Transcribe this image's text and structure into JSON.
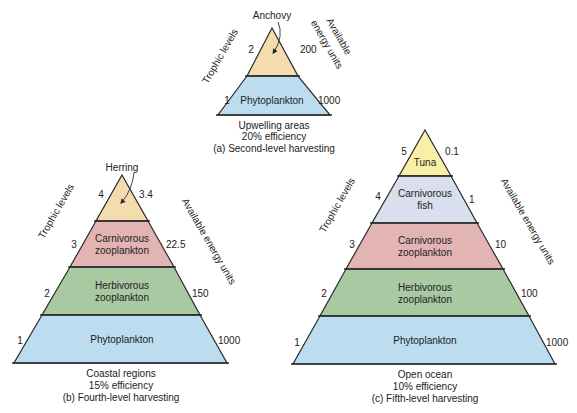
{
  "colors": {
    "top_tan": "#f5dcae",
    "tuna_yellow": "#f9f0a8",
    "carn_fish": "#d9dfec",
    "carn_zoo": "#e2b4b4",
    "herb_zoo": "#a9c9a3",
    "phyto": "#bcdcf0",
    "outline": "#2a2a2a"
  },
  "pyramid_a": {
    "axis_left": "Trophic levels",
    "axis_right": "Available energy units",
    "axis_right_line1": "Available",
    "axis_right_line2": "energy units",
    "callout": "Anchovy",
    "layers": [
      {
        "level": "2",
        "energy": "200",
        "label": ""
      },
      {
        "level": "1",
        "energy": "1000",
        "label": "Phytoplankton"
      }
    ],
    "caption": [
      "Upwelling areas",
      "20% efficiency",
      "(a) Second-level harvesting"
    ]
  },
  "pyramid_b": {
    "axis_left": "Trophic levels",
    "axis_right": "Available energy units",
    "callout": "Herring",
    "layers": [
      {
        "level": "4",
        "energy": "3.4",
        "label": ""
      },
      {
        "level": "3",
        "energy": "22.5",
        "label_1": "Carnivorous",
        "label_2": "zooplankton"
      },
      {
        "level": "2",
        "energy": "150",
        "label_1": "Herbivorous",
        "label_2": "zooplankton"
      },
      {
        "level": "1",
        "energy": "1000",
        "label": "Phytoplankton"
      }
    ],
    "caption": [
      "Coastal regions",
      "15% efficiency",
      "(b) Fourth-level harvesting"
    ]
  },
  "pyramid_c": {
    "axis_left": "Trophic levels",
    "axis_right": "Available energy units",
    "layers": [
      {
        "level": "5",
        "energy": "0.1",
        "label": "Tuna"
      },
      {
        "level": "4",
        "energy": "1",
        "label_1": "Carnivorous",
        "label_2": "fish"
      },
      {
        "level": "3",
        "energy": "10",
        "label_1": "Carnivorous",
        "label_2": "zooplankton"
      },
      {
        "level": "2",
        "energy": "100",
        "label_1": "Herbivorous",
        "label_2": "zooplankton"
      },
      {
        "level": "1",
        "energy": "1000",
        "label": "Phytoplankton"
      }
    ],
    "caption": [
      "Open ocean",
      "10% efficiency",
      "(c) Fifth-level harvesting"
    ]
  }
}
